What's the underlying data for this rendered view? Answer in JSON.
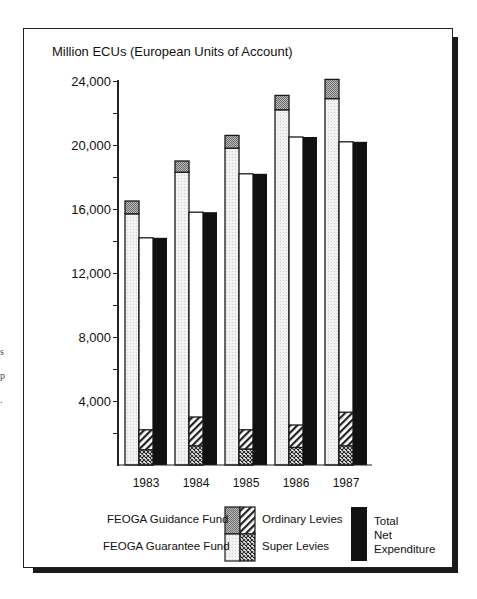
{
  "chart_data": {
    "type": "bar",
    "title": "Million ECUs (European Units of Account)",
    "xlabel": "",
    "ylabel": "Million ECUs (European Units of Account)",
    "ylim": [
      0,
      24000
    ],
    "yticks": [
      "4,000",
      "8,000",
      "12,000",
      "16,000",
      "20,000",
      "24,000"
    ],
    "minor_tick_step": 2000,
    "categories": [
      "1983",
      "1984",
      "1985",
      "1986",
      "1987"
    ],
    "grid": false,
    "legend_position": "bottom",
    "groups": [
      {
        "name": "FEOGA expenditure (stacked)",
        "stack": [
          "FEOGA Guarantee Fund",
          "FEOGA Guidance Fund"
        ]
      },
      {
        "name": "Levies (stacked)",
        "stack": [
          "Super Levies",
          "Ordinary Levies"
        ]
      },
      {
        "name": "Total Net Expenditure"
      }
    ],
    "series": [
      {
        "name": "FEOGA Guarantee Fund",
        "values": [
          15700,
          18300,
          19800,
          22200,
          22900
        ],
        "pattern": "light-dotted",
        "color": "#ececec"
      },
      {
        "name": "FEOGA Guidance Fund",
        "values": [
          800,
          700,
          800,
          900,
          1200
        ],
        "pattern": "dense-dotted",
        "color": "#9a9a9a"
      },
      {
        "name": "Super Levies",
        "values": [
          950,
          1200,
          1000,
          1100,
          1200
        ],
        "pattern": "crosshatch",
        "color": "#555555"
      },
      {
        "name": "Ordinary Levies",
        "values": [
          1250,
          1800,
          1200,
          1400,
          2100
        ],
        "pattern": "diagonal-stripes",
        "color": "#444444"
      },
      {
        "name": "Total Net Expenditure",
        "values": [
          14200,
          15800,
          18200,
          20500,
          20200
        ],
        "pattern": "solid",
        "color": "#111111"
      }
    ],
    "stack_totals": {
      "FEOGA": [
        16500,
        19000,
        20600,
        23100,
        24100
      ],
      "Levies": [
        2200,
        3000,
        2200,
        2500,
        3300
      ]
    }
  },
  "legend": {
    "guidance": "FEOGA Guidance Fund",
    "guarantee": "FEOGA Guarantee Fund",
    "ordinary": "Ordinary Levies",
    "super": "Super Levies",
    "net1": "Total",
    "net2": "Net",
    "net3": "Expenditure"
  },
  "margin_marks": [
    "s",
    "p",
    "."
  ]
}
